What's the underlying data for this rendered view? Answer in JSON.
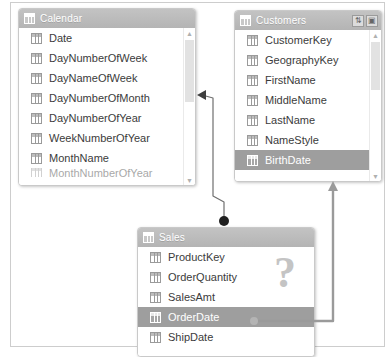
{
  "diagram": {
    "tables": [
      {
        "id": "calendar",
        "name": "Calendar",
        "icon": "table-grid-icon",
        "fields": [
          {
            "label": "Date",
            "selected": false
          },
          {
            "label": "DayNumberOfWeek",
            "selected": false
          },
          {
            "label": "DayNameOfWeek",
            "selected": false
          },
          {
            "label": "DayNumberOfMonth",
            "selected": false
          },
          {
            "label": "DayNumberOfYear",
            "selected": false
          },
          {
            "label": "WeekNumberOfYear",
            "selected": false
          },
          {
            "label": "MonthName",
            "selected": false
          },
          {
            "label": "MonthNumberOfYear",
            "selected": false,
            "clipped": true
          }
        ]
      },
      {
        "id": "customers",
        "name": "Customers",
        "icon": "table-grid-icon",
        "header_buttons": [
          {
            "name": "sort-fields-button",
            "glyph": "⇅"
          },
          {
            "name": "maximize-button",
            "glyph": "▣"
          }
        ],
        "fields": [
          {
            "label": "CustomerKey",
            "selected": false
          },
          {
            "label": "GeographyKey",
            "selected": false
          },
          {
            "label": "FirstName",
            "selected": false
          },
          {
            "label": "MiddleName",
            "selected": false
          },
          {
            "label": "LastName",
            "selected": false
          },
          {
            "label": "NameStyle",
            "selected": false
          },
          {
            "label": "BirthDate",
            "selected": true
          }
        ]
      },
      {
        "id": "sales",
        "name": "Sales",
        "icon": "table-grid-icon",
        "overlay_glyph": "?",
        "fields": [
          {
            "label": "ProductKey",
            "selected": false
          },
          {
            "label": "OrderQuantity",
            "selected": false
          },
          {
            "label": "SalesAmt",
            "selected": false
          },
          {
            "label": "OrderDate",
            "selected": true
          },
          {
            "label": "ShipDate",
            "selected": false
          }
        ]
      }
    ],
    "relationships": [
      {
        "name": "sales-orderdate-to-calendar",
        "from_table": "Sales",
        "from_field": "OrderDate",
        "to_table": "Calendar",
        "to_field": "Date",
        "from_marker": "many-dot",
        "to_marker": "arrow"
      },
      {
        "name": "sales-orderdate-to-customers-birthdate",
        "from_table": "Sales",
        "from_field": "OrderDate",
        "to_table": "Customers",
        "to_field": "BirthDate",
        "from_marker": "dot",
        "to_marker": "arrow"
      }
    ],
    "colors": {
      "header": "#b8b8b8",
      "selected_row": "#9e9e9e",
      "connector": "#8a8a8a",
      "card_border": "#c9c9c9",
      "question_mark": "#c4c4c4"
    }
  }
}
